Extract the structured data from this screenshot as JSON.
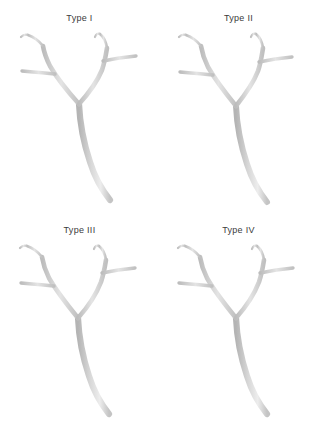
{
  "figure": {
    "background_color": "#ffffff",
    "layout": "2x2-grid",
    "label_color": "#3b3b3b",
    "vessel_color_light": "#e2e2e2",
    "vessel_color_mid": "#c9c9c9",
    "vessel_color_dark": "#a6a6a6"
  },
  "panels": [
    {
      "id": "type-1",
      "label": "Type I",
      "row": 0,
      "col": 0
    },
    {
      "id": "type-2",
      "label": "Type II",
      "row": 0,
      "col": 1
    },
    {
      "id": "type-3",
      "label": "Type III",
      "row": 1,
      "col": 0
    },
    {
      "id": "type-4",
      "label": "Type IV",
      "row": 1,
      "col": 1
    }
  ],
  "vessel_anatomy": {
    "description": "Y-shaped vessel bifurcation tree",
    "parts": [
      "main-trunk",
      "left-primary-branch",
      "right-primary-branch",
      "left-upper-fork",
      "left-lateral-branch",
      "right-upper-fork",
      "right-lateral-branch"
    ]
  }
}
